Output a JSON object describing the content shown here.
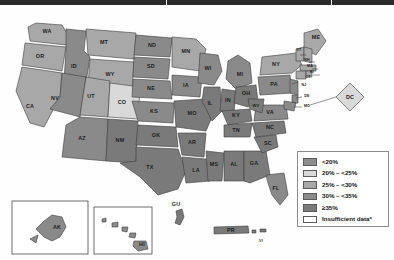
{
  "map": {
    "title": "United States choropleth map",
    "legend": {
      "items": [
        {
          "label": "<20%",
          "color": "#8d8d8d",
          "class": "s1"
        },
        {
          "label": "20% – <25%",
          "color": "#d9d9d9",
          "class": "s2"
        },
        {
          "label": "25% – <30%",
          "color": "#a8a8a8",
          "class": "s3"
        },
        {
          "label": "30% – <35%",
          "color": "#8a8a8a",
          "class": "s4"
        },
        {
          "label": "≥35%",
          "color": "#7a7a7a",
          "class": "s5"
        },
        {
          "label": "Insufficient data*",
          "color": "#ffffff",
          "class": "s0"
        }
      ]
    },
    "states": [
      {
        "abbr": "WA",
        "x": 47,
        "y": 27
      },
      {
        "abbr": "OR",
        "x": 40,
        "y": 52
      },
      {
        "abbr": "ID",
        "x": 74,
        "y": 62
      },
      {
        "abbr": "MT",
        "x": 104,
        "y": 38
      },
      {
        "abbr": "WY",
        "x": 110,
        "y": 72
      },
      {
        "abbr": "NV",
        "x": 55,
        "y": 96
      },
      {
        "abbr": "CA",
        "x": 30,
        "y": 104
      },
      {
        "abbr": "UT",
        "x": 83,
        "y": 98
      },
      {
        "abbr": "CO",
        "x": 118,
        "y": 98
      },
      {
        "abbr": "AZ",
        "x": 72,
        "y": 138
      },
      {
        "abbr": "NM",
        "x": 108,
        "y": 140
      },
      {
        "abbr": "ND",
        "x": 152,
        "y": 41
      },
      {
        "abbr": "SD",
        "x": 152,
        "y": 62
      },
      {
        "abbr": "NE",
        "x": 155,
        "y": 85
      },
      {
        "abbr": "KS",
        "x": 158,
        "y": 108
      },
      {
        "abbr": "OK",
        "x": 160,
        "y": 134
      },
      {
        "abbr": "TX",
        "x": 152,
        "y": 166
      },
      {
        "abbr": "MN",
        "x": 185,
        "y": 48
      },
      {
        "abbr": "IA",
        "x": 187,
        "y": 83
      },
      {
        "abbr": "MO",
        "x": 196,
        "y": 110
      },
      {
        "abbr": "AR",
        "x": 195,
        "y": 140
      },
      {
        "abbr": "LA",
        "x": 202,
        "y": 168
      },
      {
        "abbr": "WI",
        "x": 206,
        "y": 62
      },
      {
        "abbr": "IL",
        "x": 212,
        "y": 97
      },
      {
        "abbr": "MS",
        "x": 216,
        "y": 156
      },
      {
        "abbr": "IN",
        "x": 229,
        "y": 96
      },
      {
        "abbr": "MI",
        "x": 241,
        "y": 70
      },
      {
        "abbr": "OH",
        "x": 246,
        "y": 90
      },
      {
        "abbr": "KY",
        "x": 240,
        "y": 110
      },
      {
        "abbr": "TN",
        "x": 235,
        "y": 125
      },
      {
        "abbr": "AL",
        "x": 234,
        "y": 156
      },
      {
        "abbr": "GA",
        "x": 253,
        "y": 156
      },
      {
        "abbr": "FL",
        "x": 276,
        "y": 185
      },
      {
        "abbr": "SC",
        "x": 268,
        "y": 139
      },
      {
        "abbr": "NC",
        "x": 272,
        "y": 125
      },
      {
        "abbr": "VA",
        "x": 272,
        "y": 108
      },
      {
        "abbr": "WV",
        "x": 257,
        "y": 102
      },
      {
        "abbr": "PA",
        "x": 276,
        "y": 80
      },
      {
        "abbr": "NY",
        "x": 288,
        "y": 62
      },
      {
        "abbr": "ME",
        "x": 316,
        "y": 38
      }
    ],
    "small_states": [
      {
        "abbr": "VT",
        "x": 300,
        "y": 48
      },
      {
        "abbr": "NH",
        "x": 309,
        "y": 56
      },
      {
        "abbr": "MA",
        "x": 311,
        "y": 64
      },
      {
        "abbr": "RI",
        "x": 313,
        "y": 70
      },
      {
        "abbr": "CT",
        "x": 307,
        "y": 70
      },
      {
        "abbr": "NJ",
        "x": 303,
        "y": 83
      },
      {
        "abbr": "DE",
        "x": 305,
        "y": 93
      },
      {
        "abbr": "MD",
        "x": 305,
        "y": 103
      }
    ],
    "callout": {
      "abbr": "DC",
      "x": 349,
      "y": 98
    },
    "insets": [
      {
        "abbr": "AK",
        "x": 65,
        "y": 222
      },
      {
        "abbr": "HI",
        "x": 138,
        "y": 232
      }
    ],
    "territories": [
      {
        "abbr": "GU",
        "x": 182,
        "y": 210
      },
      {
        "abbr": "PR",
        "x": 231,
        "y": 227
      },
      {
        "abbr": "VI",
        "x": 261,
        "y": 240
      }
    ]
  }
}
